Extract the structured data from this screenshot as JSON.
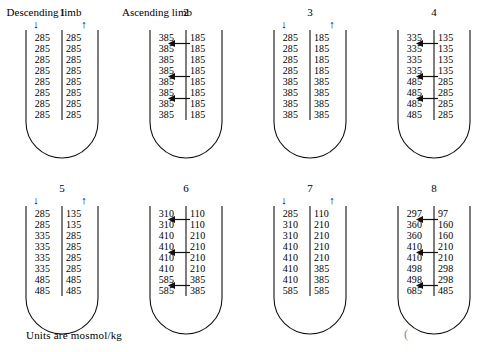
{
  "figure": {
    "descending_limb_label": "Descending limb",
    "ascending_limb_label": "Ascending limb",
    "units_caption": "Units are mosmol/kg",
    "stray_mark": "(",
    "arrow_down_glyph": "↓",
    "arrow_up_glyph": "↑",
    "ink_color": "#111111",
    "background_color": "#ffffff"
  },
  "panels": [
    {
      "number": "1",
      "show_limb_arrows": true,
      "rows": [
        {
          "descending": "285",
          "ascending": "285"
        },
        {
          "descending": "285",
          "ascending": "285"
        },
        {
          "descending": "285",
          "ascending": "285"
        },
        {
          "descending": "285",
          "ascending": "285"
        },
        {
          "descending": "285",
          "ascending": "285"
        },
        {
          "descending": "285",
          "ascending": "285"
        },
        {
          "descending": "285",
          "ascending": "285"
        },
        {
          "descending": "285",
          "ascending": "285"
        }
      ],
      "pump_arrows": []
    },
    {
      "number": "2",
      "show_limb_arrows": false,
      "rows": [
        {
          "descending": "385",
          "ascending": "185"
        },
        {
          "descending": "385",
          "ascending": "185"
        },
        {
          "descending": "385",
          "ascending": "185"
        },
        {
          "descending": "385",
          "ascending": "185"
        },
        {
          "descending": "385",
          "ascending": "185"
        },
        {
          "descending": "385",
          "ascending": "185"
        },
        {
          "descending": "385",
          "ascending": "185"
        },
        {
          "descending": "385",
          "ascending": "185"
        }
      ],
      "pump_arrows": [
        1,
        4,
        6
      ]
    },
    {
      "number": "3",
      "show_limb_arrows": true,
      "rows": [
        {
          "descending": "285",
          "ascending": "185"
        },
        {
          "descending": "285",
          "ascending": "185"
        },
        {
          "descending": "285",
          "ascending": "185"
        },
        {
          "descending": "285",
          "ascending": "185"
        },
        {
          "descending": "385",
          "ascending": "385"
        },
        {
          "descending": "385",
          "ascending": "385"
        },
        {
          "descending": "385",
          "ascending": "385"
        },
        {
          "descending": "385",
          "ascending": "385"
        }
      ],
      "pump_arrows": []
    },
    {
      "number": "4",
      "show_limb_arrows": false,
      "rows": [
        {
          "descending": "335",
          "ascending": "135"
        },
        {
          "descending": "335",
          "ascending": "135"
        },
        {
          "descending": "335",
          "ascending": "135"
        },
        {
          "descending": "335",
          "ascending": "135"
        },
        {
          "descending": "485",
          "ascending": "285"
        },
        {
          "descending": "485",
          "ascending": "285"
        },
        {
          "descending": "485",
          "ascending": "285"
        },
        {
          "descending": "485",
          "ascending": "285"
        }
      ],
      "pump_arrows": [
        1,
        4,
        6
      ]
    },
    {
      "number": "5",
      "show_limb_arrows": true,
      "rows": [
        {
          "descending": "285",
          "ascending": "135"
        },
        {
          "descending": "285",
          "ascending": "135"
        },
        {
          "descending": "335",
          "ascending": "285"
        },
        {
          "descending": "335",
          "ascending": "285"
        },
        {
          "descending": "335",
          "ascending": "285"
        },
        {
          "descending": "335",
          "ascending": "285"
        },
        {
          "descending": "485",
          "ascending": "485"
        },
        {
          "descending": "485",
          "ascending": "485"
        }
      ],
      "pump_arrows": []
    },
    {
      "number": "6",
      "show_limb_arrows": false,
      "rows": [
        {
          "descending": "310",
          "ascending": "110"
        },
        {
          "descending": "310",
          "ascending": "110"
        },
        {
          "descending": "410",
          "ascending": "210"
        },
        {
          "descending": "410",
          "ascending": "210"
        },
        {
          "descending": "410",
          "ascending": "210"
        },
        {
          "descending": "410",
          "ascending": "210"
        },
        {
          "descending": "585",
          "ascending": "385"
        },
        {
          "descending": "585",
          "ascending": "385"
        }
      ],
      "pump_arrows": [
        1,
        4,
        7
      ]
    },
    {
      "number": "7",
      "show_limb_arrows": true,
      "rows": [
        {
          "descending": "285",
          "ascending": "110"
        },
        {
          "descending": "310",
          "ascending": "210"
        },
        {
          "descending": "310",
          "ascending": "210"
        },
        {
          "descending": "410",
          "ascending": "210"
        },
        {
          "descending": "410",
          "ascending": "210"
        },
        {
          "descending": "410",
          "ascending": "385"
        },
        {
          "descending": "410",
          "ascending": "385"
        },
        {
          "descending": "585",
          "ascending": "585"
        }
      ],
      "pump_arrows": []
    },
    {
      "number": "8",
      "show_limb_arrows": false,
      "rows": [
        {
          "descending": "297",
          "ascending": "97"
        },
        {
          "descending": "360",
          "ascending": "160"
        },
        {
          "descending": "360",
          "ascending": "160"
        },
        {
          "descending": "410",
          "ascending": "210"
        },
        {
          "descending": "410",
          "ascending": "210"
        },
        {
          "descending": "498",
          "ascending": "298"
        },
        {
          "descending": "498",
          "ascending": "298"
        },
        {
          "descending": "685",
          "ascending": "485"
        }
      ],
      "pump_arrows": [
        1,
        4,
        7
      ]
    }
  ]
}
